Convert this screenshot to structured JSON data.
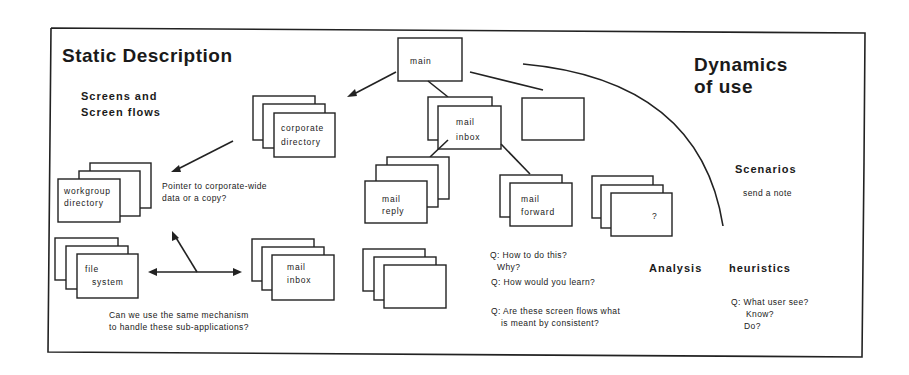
{
  "titles": {
    "static_description": "Static Description",
    "dynamics_line1": "Dynamics",
    "dynamics_line2": "of use"
  },
  "subtitles": {
    "screens_line1": "Screens and",
    "screens_line2": "Screen flows",
    "scenarios": "Scenarios",
    "send_note": "send a note",
    "analysis": "Analysis",
    "heuristics": "heuristics"
  },
  "screens": {
    "main": "main",
    "mail_inbox_top_1": "mail",
    "mail_inbox_top_2": "inbox",
    "corporate_1": "corporate",
    "corporate_2": "directory",
    "workgroup_1": "workgroup",
    "workgroup_2": "directory",
    "file_1": "file",
    "file_2": "system",
    "mail_inbox_bottom_1": "mail",
    "mail_inbox_bottom_2": "inbox",
    "mail_reply_1": "mail",
    "mail_reply_2": "reply",
    "mail_forward_1": "mail",
    "mail_forward_2": "forward",
    "unknown": "?"
  },
  "notes": {
    "pointer_1": "Pointer to corporate-wide",
    "pointer_2": "data or a copy?",
    "mechanism_1": "Can we use the  same mechanism",
    "mechanism_2": "to handle these sub-applications?",
    "q_how_1": "Q: How to do this?",
    "q_how_2": "Why?",
    "q_learn": "Q: How would you learn?",
    "q_consistent_1": "Q: Are these screen flows what",
    "q_consistent_2": "is meant by consistent?",
    "q_user_1": "Q: What user see?",
    "q_user_2": "Know?",
    "q_user_3": "Do?"
  }
}
